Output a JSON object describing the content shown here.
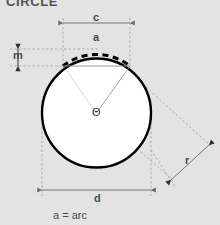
{
  "diagram": {
    "title": "CIRCLE",
    "caption": "a = arc",
    "background_color": "#e3e3e3",
    "stroke_color": "#000000",
    "dim_line_color": "#808080",
    "fill_color": "#ffffff",
    "labels": {
      "chord": "c",
      "arc": "a",
      "middle_ordinate": "m",
      "angle": "Θ",
      "radius": "r",
      "diameter": "d"
    },
    "geometry": {
      "center_x": 96.5,
      "center_y": 113,
      "radius_px": 55,
      "chord_y": 66,
      "chord_left_x": 63,
      "chord_right_x": 130,
      "diameter_line_y": 190,
      "diameter_left_x": 42,
      "diameter_right_x": 151,
      "chord_dim_line_y": 23,
      "m_dim_line_x": 18,
      "m_top_y": 49,
      "m_bottom_y": 66,
      "r_dim_start_x": 171,
      "r_dim_start_y": 180,
      "r_dim_end_x": 209,
      "r_dim_end_y": 145
    }
  }
}
